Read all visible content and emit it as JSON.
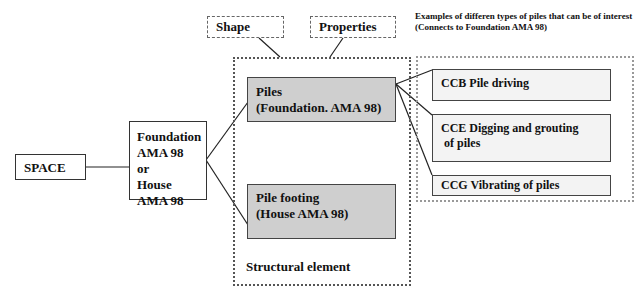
{
  "diagram": {
    "space": "SPACE",
    "foundation": [
      "Foundation",
      "AMA 98 or",
      "House",
      "AMA 98"
    ],
    "shape": "Shape",
    "properties": "Properties",
    "piles": [
      "Piles",
      "(Foundation. AMA 98)"
    ],
    "pile_footing": [
      "Pile footing",
      "(House AMA 98)"
    ],
    "structural_element": "Structural element",
    "examples_note": [
      "Examples of differen types of piles that can be of interest",
      "(Connects to Foundation AMA 98)"
    ],
    "pile_types": [
      {
        "code": "CCB",
        "label": "CCB Pile driving"
      },
      {
        "code": "CCE",
        "label": "CCE Digging and grouting",
        "label2": " of piles"
      },
      {
        "code": "CCG",
        "label": "CCG Vibrating of piles"
      }
    ]
  }
}
